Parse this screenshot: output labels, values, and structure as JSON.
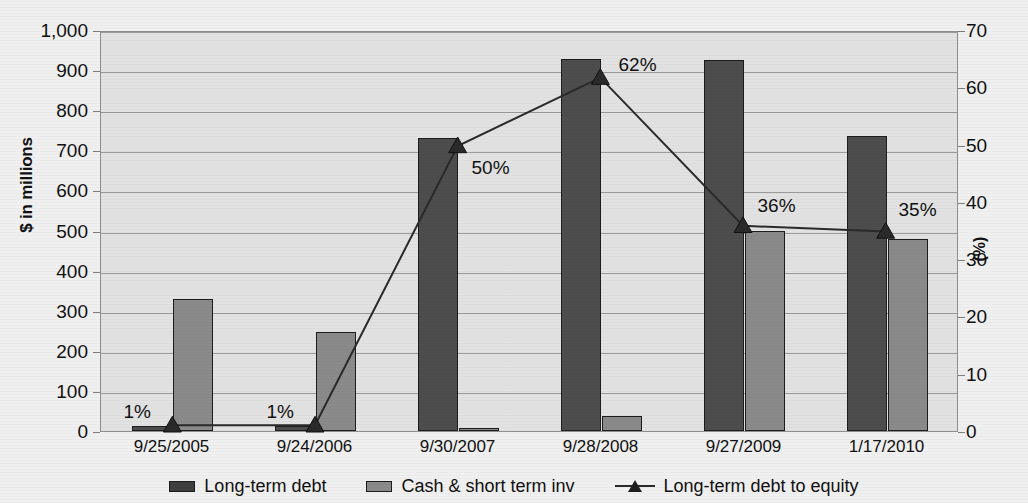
{
  "chart_data": {
    "type": "bar",
    "title": "",
    "categories": [
      "9/25/2005",
      "9/24/2006",
      "9/30/2007",
      "9/28/2008",
      "9/27/2009",
      "1/17/2010"
    ],
    "series": [
      {
        "name": "Long-term debt",
        "type": "bar",
        "axis": "left",
        "color": "#4d4d4d",
        "values": [
          13,
          12,
          731,
          928,
          925,
          735
        ]
      },
      {
        "name": "Cash & short term inv",
        "type": "bar",
        "axis": "left",
        "color": "#8a8a8a",
        "values": [
          329,
          247,
          7,
          38,
          499,
          479
        ]
      },
      {
        "name": "Long-term debt to equity",
        "type": "line",
        "axis": "right",
        "color": "#2a2a2a",
        "marker": "triangle",
        "values": [
          1,
          1,
          50,
          62,
          36,
          35
        ],
        "data_labels": [
          "1%",
          "1%",
          "50%",
          "62%",
          "36%",
          "35%"
        ]
      }
    ],
    "xlabel": "",
    "ylabel": "$ in millions",
    "ylabel_right": "(%)",
    "ylim": [
      0,
      1000
    ],
    "ylim_right": [
      0,
      70
    ],
    "yticks": [
      "0",
      "100",
      "200",
      "300",
      "400",
      "500",
      "600",
      "700",
      "800",
      "900",
      "1,000"
    ],
    "yticks_right": [
      "0",
      "10",
      "20",
      "30",
      "40",
      "50",
      "60",
      "70"
    ],
    "grid": true,
    "legend_position": "bottom",
    "legend": [
      "Long-term debt",
      "Cash & short term inv",
      "Long-term debt to equity"
    ]
  },
  "axes": {
    "left_title": "$ in millions",
    "right_title": "(%)"
  }
}
